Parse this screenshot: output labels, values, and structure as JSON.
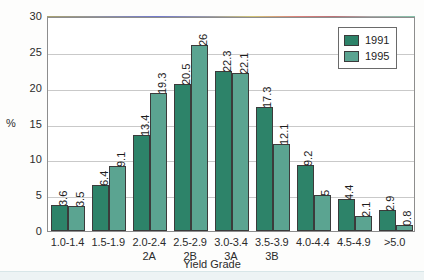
{
  "chart_data": {
    "type": "bar",
    "title": "",
    "xlabel": "Yield Grade",
    "ylabel": "%",
    "ylim": [
      0,
      30
    ],
    "yticks": [
      0,
      5,
      10,
      15,
      20,
      25,
      30
    ],
    "grid": true,
    "legend_position": "top-right",
    "categories": [
      "1.0-1.4",
      "1.5-1.9",
      "2.0-2.4",
      "2.5-2.9",
      "3.0-3.4",
      "3.5-3.9",
      "4.0-4.4",
      "4.5-4.9",
      ">5.0"
    ],
    "category_sublabels": [
      "",
      "",
      "2A",
      "2B",
      "3A",
      "3B",
      "",
      "",
      ""
    ],
    "series": [
      {
        "name": "1991",
        "color": "#2d8369",
        "values": [
          3.6,
          6.4,
          13.4,
          20.5,
          22.3,
          17.3,
          9.2,
          4.4,
          2.9
        ],
        "labels": [
          "3.6",
          "6.4",
          "13.4",
          "20.5",
          "22.3",
          "17.3",
          "9.2",
          "4.4",
          "2.9"
        ]
      },
      {
        "name": "1995",
        "color": "#5ba491",
        "values": [
          3.5,
          9.1,
          19.3,
          26,
          22.1,
          12.1,
          5,
          2.1,
          0.8
        ],
        "labels": [
          "3.5",
          "9.1",
          "19.3",
          "26",
          "22.1",
          "12.1",
          "5",
          "2.1",
          "0.8"
        ]
      }
    ]
  }
}
